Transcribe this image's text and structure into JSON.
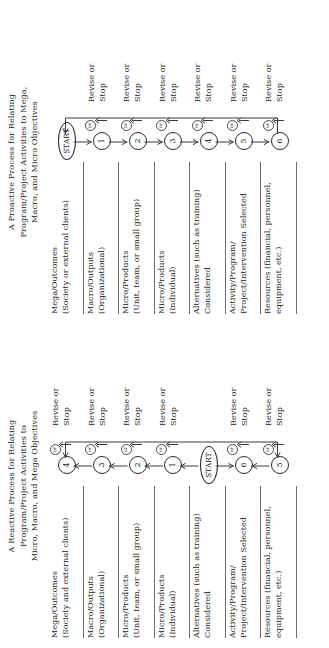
{
  "figure": {
    "orientation": "rotated-90-ccw",
    "panels": [
      {
        "id": "reactive",
        "title_lines": [
          "A Reactive Process for Relating",
          "Program/Project Activities to",
          "Micro, Macro, and Mega Objectives"
        ],
        "rows": [
          {
            "label_line1": "Mega/Outcomes",
            "label_line2": "(Society and external clients)",
            "node": "4",
            "or_label": "or",
            "revise_line1": "Revise or",
            "revise_line2": "Stop"
          },
          {
            "label_line1": "Macro/Outputs",
            "label_line2": "(Organizational)",
            "node": "3",
            "or_label": "or",
            "revise_line1": "Revise or",
            "revise_line2": "Stop"
          },
          {
            "label_line1": "Micro/Products",
            "label_line2": "(Unit, team, or small group)",
            "node": "2",
            "or_label": "or",
            "revise_line1": "Revise or",
            "revise_line2": "Stop"
          },
          {
            "label_line1": "Micro/Products",
            "label_line2": "(Individual)",
            "node": "1",
            "or_label": "or",
            "revise_line1": "Revise or",
            "revise_line2": "Stop"
          },
          {
            "label_line1": "Alternatives (such as training)",
            "label_line2": "Considered",
            "node": "START",
            "or_label": "",
            "revise_line1": "",
            "revise_line2": ""
          },
          {
            "label_line1": "Activity/Program/",
            "label_line2": "Project/Intervention Selected",
            "node": "6",
            "or_label": "or",
            "revise_line1": "Revise or",
            "revise_line2": "Stop"
          },
          {
            "label_line1": "Resources (financial, personnel,",
            "label_line2": "equipment, etc.)",
            "node": "5",
            "or_label": "or",
            "revise_line1": "Revise or",
            "revise_line2": "Stop"
          }
        ]
      },
      {
        "id": "proactive",
        "title_lines": [
          "A Proactive Process for Relating",
          "Program/Project Activities to Mega,",
          "Macro, and Micro Objectives"
        ],
        "rows": [
          {
            "label_line1": "Mega/Outcomes",
            "label_line2": "(Society or external clients)",
            "node": "START",
            "or_label": "",
            "revise_line1": "",
            "revise_line2": ""
          },
          {
            "label_line1": "Macro/Outputs",
            "label_line2": "(Organizational)",
            "node": "1",
            "or_label": "or",
            "revise_line1": "Revise or",
            "revise_line2": "Stop"
          },
          {
            "label_line1": "Micro/Products",
            "label_line2": "(Unit, team, or small group)",
            "node": "2",
            "or_label": "or",
            "revise_line1": "Revise or",
            "revise_line2": "Stop"
          },
          {
            "label_line1": "Micro/Products",
            "label_line2": "(Individual)",
            "node": "3",
            "or_label": "or",
            "revise_line1": "Revise or",
            "revise_line2": "Stop"
          },
          {
            "label_line1": "Alternatives (such as training)",
            "label_line2": "Considered",
            "node": "4",
            "or_label": "or",
            "revise_line1": "Revise or",
            "revise_line2": "Stop"
          },
          {
            "label_line1": "Activity/Program/",
            "label_line2": "Project/Intervention Selected",
            "node": "5",
            "or_label": "or",
            "revise_line1": "Revise or",
            "revise_line2": "Stop"
          },
          {
            "label_line1": "Resources (financial, personnel,",
            "label_line2": "equipment, etc.)",
            "node": "6",
            "or_label": "or",
            "revise_line1": "Revise or",
            "revise_line2": "Stop"
          }
        ]
      }
    ]
  },
  "colors": {
    "ink": "#1a1a1a",
    "line": "#3a3a3a",
    "rule": "#6d6d6d",
    "background": "#ffffff"
  }
}
